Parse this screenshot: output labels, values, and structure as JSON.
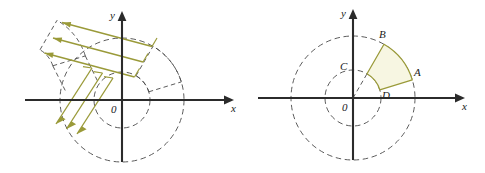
{
  "figure": {
    "background_color": "#ffffff",
    "width": 485,
    "height": 173,
    "axis_color": "#2b2b2b",
    "dash_color": "#4a4a4a",
    "accent_color": "#9a9a39",
    "fill_color": "#f7f6e2"
  },
  "panels": [
    {
      "id": "left",
      "name": "translated-sector-panel",
      "origin_label": "0",
      "x_axis_label": "x",
      "y_axis_label": "y",
      "inner_radius": 28,
      "outer_radius": 62,
      "sector_start_angle_deg": 17,
      "sector_end_angle_deg": 60,
      "translation_vector": [
        -96,
        -26
      ],
      "arrow_count": 6,
      "sector_style": "dashed-outline-translated",
      "point_labels": []
    },
    {
      "id": "right",
      "name": "annulus-sector-panel",
      "origin_label": "0",
      "x_axis_label": "x",
      "y_axis_label": "y",
      "inner_radius": 28,
      "outer_radius": 62,
      "sector_start_angle_deg": 17,
      "sector_end_angle_deg": 60,
      "sector_style": "filled",
      "point_labels": [
        {
          "id": "A",
          "label": "A",
          "on": "outer-arc",
          "angle_deg": 17
        },
        {
          "id": "B",
          "label": "B",
          "on": "outer-arc",
          "angle_deg": 60
        },
        {
          "id": "C",
          "label": "C",
          "on": "inner-arc",
          "angle_deg": 60
        },
        {
          "id": "D",
          "label": "D",
          "on": "inner-arc",
          "angle_deg": 17
        }
      ]
    }
  ]
}
